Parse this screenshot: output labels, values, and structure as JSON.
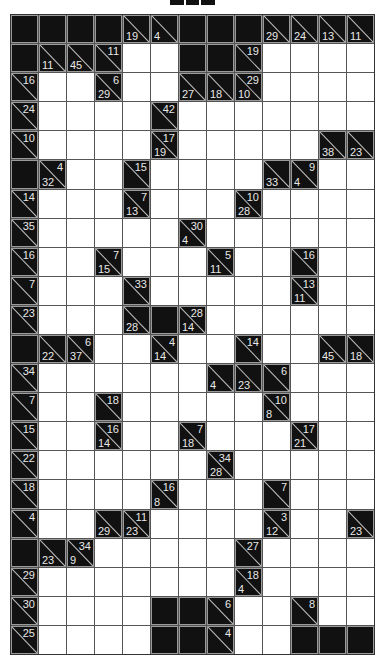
{
  "puzzle": {
    "type": "kakuro",
    "rows": 22,
    "cols": 13,
    "legend": {
      "B": "black-cell",
      "W": "empty-white-cell",
      "clue": "a = across sum (top-right), d = down sum (bottom-left)"
    },
    "colors": {
      "block": "#111111",
      "white": "#ffffff",
      "clue_text": "#e8e8e8",
      "grid_line": "#555555"
    },
    "grid": [
      [
        "B",
        "B",
        "B",
        "B",
        {
          "d": 19
        },
        {
          "d": 4
        },
        "B",
        "B",
        "B",
        {
          "d": 29
        },
        {
          "d": 24
        },
        {
          "d": 13
        },
        {
          "d": 11
        }
      ],
      [
        "B",
        {
          "d": 11
        },
        {
          "d": 45
        },
        {
          "a": 11
        },
        "W",
        "W",
        "B",
        "B",
        {
          "a": 19
        },
        "W",
        "W",
        "W",
        "W"
      ],
      [
        {
          "a": 16
        },
        "W",
        "W",
        {
          "a": 6,
          "d": 29
        },
        "W",
        "W",
        {
          "d": 27
        },
        {
          "d": 18
        },
        {
          "a": 29,
          "d": 10
        },
        "W",
        "W",
        "W",
        "W"
      ],
      [
        {
          "a": 24
        },
        "W",
        "W",
        "W",
        "W",
        {
          "a": 42
        },
        "W",
        "W",
        "W",
        "W",
        "W",
        "W",
        "W"
      ],
      [
        {
          "a": 10
        },
        "W",
        "W",
        "W",
        "W",
        {
          "a": 17,
          "d": 19
        },
        "W",
        "W",
        "W",
        "W",
        "W",
        {
          "d": 38
        },
        {
          "d": 23
        }
      ],
      [
        "B",
        {
          "a": 4,
          "d": 32
        },
        "W",
        "W",
        {
          "a": 15
        },
        "W",
        "W",
        "W",
        "W",
        {
          "d": 33
        },
        {
          "a": 9,
          "d": 4
        },
        "W",
        "W"
      ],
      [
        {
          "a": 14
        },
        "W",
        "W",
        "W",
        {
          "a": 7,
          "d": 13
        },
        "W",
        "W",
        "W",
        {
          "a": 10,
          "d": 28
        },
        "W",
        "W",
        "W",
        "W"
      ],
      [
        {
          "a": 35
        },
        "W",
        "W",
        "W",
        "W",
        "W",
        {
          "a": 30,
          "d": 4
        },
        "W",
        "W",
        "W",
        "W",
        "W",
        "W"
      ],
      [
        {
          "a": 16
        },
        "W",
        "W",
        {
          "a": 7,
          "d": 15
        },
        "W",
        "W",
        "W",
        {
          "a": 5,
          "d": 11
        },
        "W",
        "W",
        {
          "a": 16
        },
        "W",
        "W"
      ],
      [
        {
          "a": 7
        },
        "W",
        "W",
        "W",
        {
          "a": 33
        },
        "W",
        "W",
        "W",
        "W",
        "W",
        {
          "a": 13,
          "d": 11
        },
        "W",
        "W"
      ],
      [
        {
          "a": 23
        },
        "W",
        "W",
        "W",
        {
          "d": 28
        },
        "B",
        {
          "a": 28,
          "d": 14
        },
        "W",
        "W",
        "W",
        "W",
        "W",
        "W"
      ],
      [
        "B",
        {
          "d": 22
        },
        {
          "a": 6,
          "d": 37
        },
        "W",
        "W",
        {
          "a": 4,
          "d": 14
        },
        "W",
        "W",
        {
          "a": 14
        },
        "W",
        "W",
        {
          "d": 45
        },
        {
          "d": 18
        }
      ],
      [
        {
          "a": 34
        },
        "W",
        "W",
        "W",
        "W",
        "W",
        "W",
        {
          "d": 4
        },
        {
          "d": 23
        },
        {
          "a": 6
        },
        "W",
        "W",
        "W"
      ],
      [
        {
          "a": 7
        },
        "W",
        "W",
        {
          "a": 18
        },
        "W",
        "W",
        "W",
        "W",
        "W",
        {
          "a": 10,
          "d": 8
        },
        "W",
        "W",
        "W"
      ],
      [
        {
          "a": 15
        },
        "W",
        "W",
        {
          "a": 16,
          "d": 14
        },
        "W",
        "W",
        {
          "a": 7,
          "d": 18
        },
        "W",
        "W",
        "W",
        {
          "a": 17,
          "d": 21
        },
        "W",
        "W"
      ],
      [
        {
          "a": 22
        },
        "W",
        "W",
        "W",
        "W",
        "W",
        "W",
        {
          "a": 34,
          "d": 28
        },
        "W",
        "W",
        "W",
        "W",
        "W"
      ],
      [
        {
          "a": 18
        },
        "W",
        "W",
        "W",
        "W",
        {
          "a": 16,
          "d": 8
        },
        "W",
        "W",
        "W",
        {
          "a": 7
        },
        "W",
        "W",
        "W"
      ],
      [
        {
          "a": 4
        },
        "W",
        "W",
        {
          "d": 29
        },
        {
          "a": 11,
          "d": 23
        },
        "W",
        "W",
        "W",
        "W",
        {
          "a": 3,
          "d": 12
        },
        "W",
        "W",
        {
          "d": 23
        }
      ],
      [
        "B",
        {
          "d": 23
        },
        {
          "a": 34,
          "d": 9
        },
        "W",
        "W",
        "W",
        "W",
        "W",
        {
          "a": 27
        },
        "W",
        "W",
        "W",
        "W"
      ],
      [
        {
          "a": 29
        },
        "W",
        "W",
        "W",
        "W",
        "W",
        "W",
        "W",
        {
          "a": 18,
          "d": 4
        },
        "W",
        "W",
        "W",
        "W"
      ],
      [
        {
          "a": 30
        },
        "W",
        "W",
        "W",
        "W",
        "B",
        "B",
        {
          "a": 6
        },
        "W",
        "W",
        {
          "a": 8
        },
        "W",
        "W"
      ],
      [
        {
          "a": 25
        },
        "W",
        "W",
        "W",
        "W",
        "B",
        "B",
        {
          "a": 4
        },
        "W",
        "W",
        "B",
        "B",
        "B"
      ]
    ]
  }
}
